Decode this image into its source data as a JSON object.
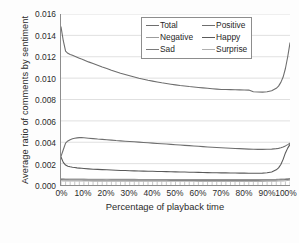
{
  "chart_data": {
    "type": "line",
    "title": "",
    "xlabel": "Percentage of playback time",
    "ylabel": "Average ratio of comments by sentiment",
    "xlim": [
      0,
      100
    ],
    "ylim": [
      0,
      0.016
    ],
    "grid": "horizontal",
    "legend_position": "top-right-inside",
    "x_tick_labels": [
      "0%",
      "10%",
      "20%",
      "30%",
      "40%",
      "50%",
      "60%",
      "70%",
      "80%",
      "90%",
      "100%"
    ],
    "x_tick_values": [
      0,
      10,
      20,
      30,
      40,
      50,
      60,
      70,
      80,
      90,
      100
    ],
    "y_tick_labels": [
      "0.000",
      "0.002",
      "0.004",
      "0.006",
      "0.008",
      "0.010",
      "0.012",
      "0.014",
      "0.016"
    ],
    "y_tick_values": [
      0.0,
      0.002,
      0.004,
      0.006,
      0.008,
      0.01,
      0.012,
      0.014,
      0.016
    ],
    "x": [
      0,
      1,
      2,
      3,
      4,
      5,
      6,
      7,
      8,
      9,
      10,
      12,
      14,
      16,
      18,
      20,
      22,
      24,
      26,
      28,
      30,
      32,
      34,
      36,
      38,
      40,
      42,
      44,
      46,
      48,
      50,
      52,
      54,
      56,
      58,
      60,
      62,
      64,
      66,
      68,
      70,
      72,
      74,
      76,
      78,
      80,
      82,
      84,
      86,
      88,
      90,
      92,
      94,
      95,
      96,
      97,
      98,
      99,
      100
    ],
    "series": [
      {
        "name": "Total",
        "color": "#6e6e6e",
        "values": [
          0.0148,
          0.0135,
          0.01252,
          0.01232,
          0.01222,
          0.01214,
          0.01205,
          0.01196,
          0.01187,
          0.01178,
          0.0117,
          0.01152,
          0.01136,
          0.0112,
          0.01104,
          0.0109,
          0.01074,
          0.0106,
          0.01046,
          0.01034,
          0.01022,
          0.0101,
          0.00999,
          0.00989,
          0.0098,
          0.00972,
          0.00964,
          0.00956,
          0.00949,
          0.00943,
          0.00937,
          0.00931,
          0.00926,
          0.00921,
          0.00917,
          0.00913,
          0.00909,
          0.00905,
          0.00901,
          0.00897,
          0.00894,
          0.00893,
          0.00892,
          0.00891,
          0.0089,
          0.00889,
          0.00888,
          0.00873,
          0.0087,
          0.00869,
          0.00872,
          0.00882,
          0.00905,
          0.00925,
          0.0096,
          0.0101,
          0.0109,
          0.012,
          0.0133
        ]
      },
      {
        "name": "Positive",
        "color": "#6e6e6e",
        "values": [
          0.00268,
          0.0033,
          0.00392,
          0.00412,
          0.00424,
          0.00432,
          0.00438,
          0.00441,
          0.00443,
          0.00443,
          0.00442,
          0.00438,
          0.00434,
          0.0043,
          0.00427,
          0.00424,
          0.0042,
          0.00416,
          0.00413,
          0.0041,
          0.00407,
          0.00404,
          0.00401,
          0.00398,
          0.00395,
          0.00392,
          0.00389,
          0.00386,
          0.00383,
          0.0038,
          0.00377,
          0.00374,
          0.00371,
          0.00368,
          0.00365,
          0.00362,
          0.00359,
          0.00356,
          0.00353,
          0.00351,
          0.00348,
          0.00346,
          0.00344,
          0.00342,
          0.0034,
          0.00338,
          0.00336,
          0.00334,
          0.00333,
          0.00333,
          0.00334,
          0.00336,
          0.0034,
          0.00343,
          0.00348,
          0.00356,
          0.00366,
          0.00378,
          0.00392
        ]
      },
      {
        "name": "Negative",
        "color": "#9c9c9c",
        "values": [
          0.00058,
          0.00057,
          0.00056,
          0.00056,
          0.00055,
          0.00055,
          0.00055,
          0.00055,
          0.00055,
          0.00055,
          0.00055,
          0.00054,
          0.00054,
          0.00054,
          0.00054,
          0.00054,
          0.00053,
          0.00053,
          0.00053,
          0.00053,
          0.00053,
          0.00053,
          0.00052,
          0.00052,
          0.00052,
          0.00052,
          0.00052,
          0.00052,
          0.00052,
          0.00052,
          0.00051,
          0.00051,
          0.00051,
          0.00051,
          0.00051,
          0.00051,
          0.00051,
          0.00051,
          0.00051,
          0.00051,
          0.00051,
          0.00051,
          0.00051,
          0.00051,
          0.00051,
          0.00051,
          0.00051,
          0.00051,
          0.00051,
          0.00051,
          0.00052,
          0.00052,
          0.00053,
          0.00054,
          0.00055,
          0.00056,
          0.00057,
          0.00059,
          0.00061
        ]
      },
      {
        "name": "Happy",
        "color": "#5a5a5a",
        "values": [
          0.00262,
          0.00212,
          0.00186,
          0.00176,
          0.0017,
          0.00166,
          0.00163,
          0.0016,
          0.00158,
          0.00156,
          0.00154,
          0.00151,
          0.00148,
          0.00146,
          0.00144,
          0.00142,
          0.0014,
          0.00138,
          0.00136,
          0.00135,
          0.00133,
          0.00132,
          0.00131,
          0.0013,
          0.00129,
          0.00128,
          0.00127,
          0.00126,
          0.00125,
          0.00124,
          0.00123,
          0.00122,
          0.00121,
          0.0012,
          0.00119,
          0.00118,
          0.00117,
          0.00116,
          0.00115,
          0.00114,
          0.00113,
          0.00113,
          0.00112,
          0.00112,
          0.00111,
          0.00111,
          0.0011,
          0.0011,
          0.0011,
          0.00111,
          0.00114,
          0.00122,
          0.00142,
          0.0016,
          0.00192,
          0.0024,
          0.003,
          0.00345,
          0.0038
        ]
      },
      {
        "name": "Sad",
        "color": "#7a7a7a",
        "values": [
          0.0005,
          0.00049,
          0.00048,
          0.00048,
          0.00047,
          0.00047,
          0.00047,
          0.00047,
          0.00047,
          0.00047,
          0.00046,
          0.00046,
          0.00046,
          0.00046,
          0.00046,
          0.00045,
          0.00045,
          0.00045,
          0.00045,
          0.00045,
          0.00045,
          0.00044,
          0.00044,
          0.00044,
          0.00044,
          0.00044,
          0.00044,
          0.00044,
          0.00044,
          0.00043,
          0.00043,
          0.00043,
          0.00043,
          0.00043,
          0.00043,
          0.00043,
          0.00043,
          0.00043,
          0.00043,
          0.00043,
          0.00043,
          0.00043,
          0.00043,
          0.00043,
          0.00043,
          0.00043,
          0.00043,
          0.00043,
          0.00043,
          0.00044,
          0.00044,
          0.00045,
          0.00046,
          0.00047,
          0.00048,
          0.00049,
          0.00051,
          0.00053,
          0.00055
        ]
      },
      {
        "name": "Surprise",
        "color": "#b0b0b0",
        "values": [
          0.0004,
          0.00039,
          0.00038,
          0.00038,
          0.00038,
          0.00037,
          0.00037,
          0.00037,
          0.00037,
          0.00037,
          0.00037,
          0.00037,
          0.00036,
          0.00036,
          0.00036,
          0.00036,
          0.00036,
          0.00036,
          0.00036,
          0.00036,
          0.00035,
          0.00035,
          0.00035,
          0.00035,
          0.00035,
          0.00035,
          0.00035,
          0.00035,
          0.00035,
          0.00035,
          0.00035,
          0.00035,
          0.00035,
          0.00035,
          0.00035,
          0.00034,
          0.00034,
          0.00034,
          0.00034,
          0.00034,
          0.00034,
          0.00034,
          0.00034,
          0.00034,
          0.00034,
          0.00034,
          0.00034,
          0.00034,
          0.00034,
          0.00034,
          0.00035,
          0.00035,
          0.00036,
          0.00037,
          0.00038,
          0.00039,
          0.0004,
          0.00042,
          0.00044
        ]
      }
    ]
  },
  "legend": {
    "entries": [
      {
        "label": "Total",
        "color": "#6e6e6e"
      },
      {
        "label": "Positive",
        "color": "#6e6e6e"
      },
      {
        "label": "Negative",
        "color": "#9c9c9c"
      },
      {
        "label": "Happy",
        "color": "#5a5a5a"
      },
      {
        "label": "Sad",
        "color": "#7a7a7a"
      },
      {
        "label": "Surprise",
        "color": "#b0b0b0"
      }
    ]
  },
  "style": {
    "gridline_color": "#d2d2d2",
    "axis_color": "#8d8d8d",
    "text_color": "#2b2b2b",
    "plot_background": "#ffffff",
    "figure_background": "#fdfdfd"
  }
}
